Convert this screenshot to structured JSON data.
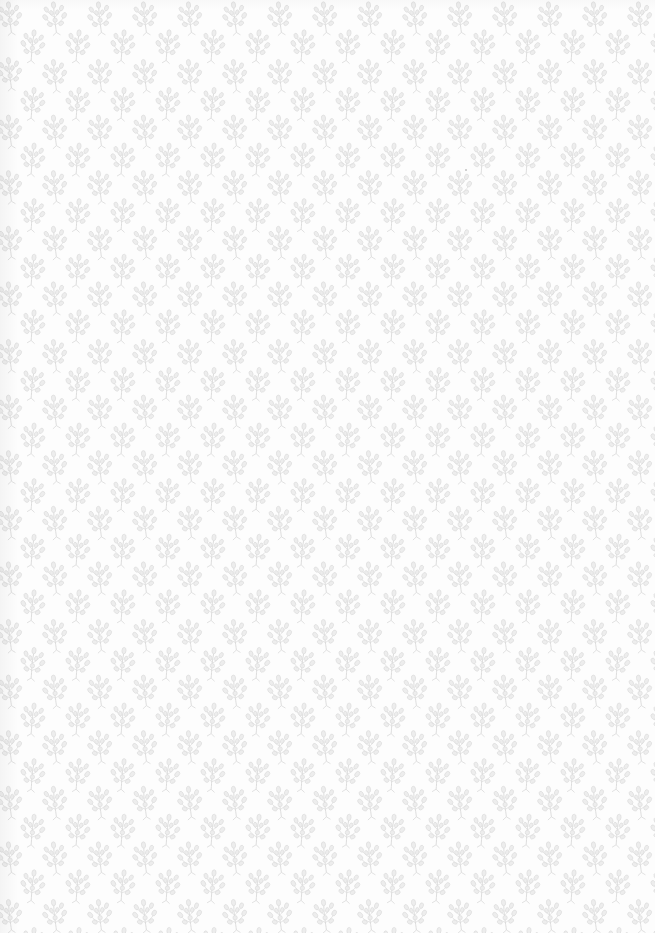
{
  "image": {
    "kind": "patterned-paper-texture",
    "description": "Repeating pattern of small light-gray botanical sprigs on a white background",
    "background_color": "#fdfdfd",
    "motif": {
      "name": "leaf-sprig",
      "stroke_color": "#d9d9d9",
      "fill_color": "#ededed",
      "horizontal_spacing_px": 45,
      "vertical_spacing_px": 28,
      "alternate_row_offset_px": 22.5
    },
    "specks": [
      {
        "x": 466,
        "y": 170,
        "color": "#9a9a9a"
      }
    ]
  }
}
